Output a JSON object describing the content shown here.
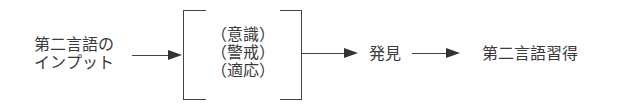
{
  "diagram": {
    "input_node": {
      "line1": "第二言語の",
      "line2": "インプット"
    },
    "filter_box": {
      "items": [
        "（意識）",
        "（警戒）",
        "（適応）"
      ]
    },
    "discovery_node": {
      "label": "発見"
    },
    "output_node": {
      "label": "第二言語習得"
    },
    "arrows": [
      {
        "from": "input_node",
        "to": "filter_box"
      },
      {
        "from": "filter_box",
        "to": "discovery_node"
      },
      {
        "from": "discovery_node",
        "to": "output_node"
      }
    ],
    "colors": {
      "line": "#444444",
      "text": "#3a3a3a"
    }
  }
}
